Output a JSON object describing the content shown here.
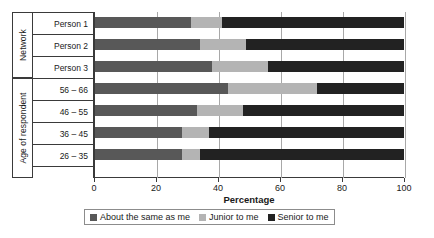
{
  "chart_data": {
    "type": "bar",
    "orientation": "horizontal",
    "stacked": true,
    "title": "",
    "xlabel": "Percentage",
    "ylabel": "",
    "xlim": [
      0,
      100
    ],
    "xticks": [
      0,
      20,
      40,
      60,
      80,
      100
    ],
    "grid": true,
    "legend_position": "bottom",
    "categories": [
      "Person 1",
      "Person 2",
      "Person 3",
      "56 – 66",
      "46 – 55",
      "36 – 45",
      "26 – 35"
    ],
    "group_labels": [
      "Network",
      "Age of respondent"
    ],
    "groups": [
      {
        "label": "Network",
        "categories": [
          "Person 1",
          "Person 2",
          "Person 3"
        ]
      },
      {
        "label": "Age of respondent",
        "categories": [
          "56 – 66",
          "46 – 55",
          "36 – 45",
          "26 – 35"
        ]
      }
    ],
    "series": [
      {
        "name": "About the same as me",
        "color": "#585858",
        "values": [
          31,
          34,
          38,
          43,
          33,
          28,
          28
        ]
      },
      {
        "name": "Junior to me",
        "color": "#b4b4b4",
        "values": [
          10,
          15,
          18,
          29,
          15,
          9,
          6
        ]
      },
      {
        "name": "Senior to me",
        "color": "#222222",
        "values": [
          59,
          51,
          44,
          28,
          52,
          63,
          66
        ]
      }
    ]
  },
  "axis": {
    "x_title": "Percentage",
    "tick_labels": [
      "0",
      "20",
      "40",
      "60",
      "80",
      "100"
    ]
  },
  "legend": {
    "items": [
      {
        "label": "About the same as me",
        "color": "#585858"
      },
      {
        "label": "Junior to me",
        "color": "#b4b4b4"
      },
      {
        "label": "Senior to me",
        "color": "#222222"
      }
    ]
  }
}
